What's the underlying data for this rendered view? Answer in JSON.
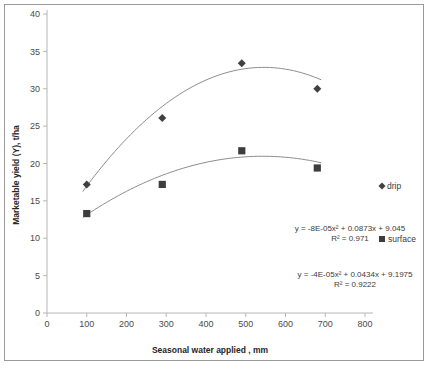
{
  "chart_data": {
    "type": "scatter",
    "title": "",
    "xlabel": "Seasonal water applied , mm",
    "ylabel": "Marketable yield (Y), t/ha",
    "xlim": [
      0,
      800
    ],
    "ylim": [
      0,
      40
    ],
    "xticks": [
      0,
      100,
      200,
      300,
      400,
      500,
      600,
      700,
      800
    ],
    "yticks": [
      0,
      5,
      10,
      15,
      20,
      25,
      30,
      35,
      40
    ],
    "grid": false,
    "legend_position": "right",
    "series": [
      {
        "name": "drip",
        "marker": "diamond",
        "color": "#404040",
        "x": [
          100,
          290,
          490,
          680
        ],
        "values": [
          17.2,
          26.1,
          33.4,
          30.0
        ],
        "trendline": {
          "type": "quadratic",
          "a": -8e-05,
          "b": 0.0873,
          "c": 9.045,
          "equation": "y = -8E-05x² + 0.0873x + 9.045",
          "r2_label": "R² = 0.971",
          "r2": 0.971
        }
      },
      {
        "name": "surface",
        "marker": "square",
        "color": "#3d3d3d",
        "x": [
          100,
          290,
          490,
          680
        ],
        "values": [
          13.3,
          17.2,
          21.7,
          19.4
        ],
        "trendline": {
          "type": "quadratic",
          "a": -4e-05,
          "b": 0.0434,
          "c": 9.1975,
          "equation": "y = -4E-05x² + 0.0434x + 9.1975",
          "r2_label": "R² = 0.9222",
          "r2": 0.9222
        }
      }
    ],
    "annotations": [
      {
        "equation": "y = -8E-05x² + 0.0873x + 9.045",
        "r2_label": "R² = 0.971"
      },
      {
        "equation": "y = -4E-05x² + 0.0434x + 9.1975",
        "r2_label": "R² = 0.9222"
      }
    ],
    "legend": [
      {
        "label": "drip",
        "marker": "diamond"
      },
      {
        "label": "surface",
        "marker": "square"
      }
    ]
  }
}
